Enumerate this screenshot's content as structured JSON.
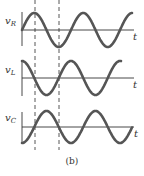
{
  "figure": {
    "caption": "(b)",
    "dashed_markers": [
      {
        "x": 35
      },
      {
        "x": 59
      }
    ],
    "colors": {
      "curve": "#555555",
      "axis": "#333333",
      "dash": "#444444"
    },
    "plots": [
      {
        "name": "vR",
        "label_main": "v",
        "label_sub": "R",
        "axis_label": "t",
        "phase": "starts at zero, rising"
      },
      {
        "name": "vL",
        "label_main": "v",
        "label_sub": "L",
        "axis_label": "t",
        "phase": "starts at maximum"
      },
      {
        "name": "vC",
        "label_main": "v",
        "label_sub": "C",
        "axis_label": "t",
        "phase": "starts at minimum"
      }
    ]
  }
}
